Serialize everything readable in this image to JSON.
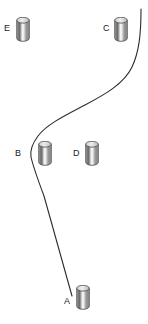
{
  "canvas": {
    "width": 148,
    "height": 324,
    "background": "#ffffff"
  },
  "diagram": {
    "path_color": "#2b2b2b",
    "path_width": 1.1,
    "label_color": "#1a1a1a"
  },
  "cylinder_style": {
    "outline": "#4a4a4a",
    "body_light": "#f2f2f2",
    "body_mid": "#9c9c9c",
    "body_dark": "#6e6e6e",
    "top_fill": "#dcdcdc",
    "width": 14,
    "height": 25
  },
  "markers": [
    {
      "id": "A",
      "label": "A",
      "label_x": 64,
      "label_y": 297,
      "cyl_x": 76,
      "cyl_y": 285,
      "is_path_end": true
    },
    {
      "id": "B",
      "label": "B",
      "label_x": 15,
      "label_y": 149,
      "cyl_x": 38,
      "cyl_y": 141,
      "is_path_end": false
    },
    {
      "id": "C",
      "label": "C",
      "label_x": 103,
      "label_y": 24,
      "cyl_x": 114,
      "cyl_y": 17,
      "is_path_end": false
    },
    {
      "id": "D",
      "label": "D",
      "label_x": 73,
      "label_y": 149,
      "cyl_x": 85,
      "cyl_y": 141,
      "is_path_end": false
    },
    {
      "id": "E",
      "label": "E",
      "label_x": 4,
      "label_y": 24,
      "cyl_x": 16,
      "cyl_y": 17,
      "is_path_end": false
    }
  ],
  "path": {
    "name": "trajectory",
    "d": "M 141 9 C 141 35 139 52 132 67 C 124 84 104 95 85 105 C 66 115 47 124 38 136 C 32 144 30 151 31 157 C 33 166 38 180 44 196 L 72 296",
    "start_point": {
      "x": 141,
      "y": 9
    },
    "end_point": {
      "x": 72,
      "y": 296
    }
  },
  "chart_data": {
    "type": "scatter",
    "xlabel": "",
    "ylabel": "",
    "xlim": [
      0,
      148
    ],
    "ylim": [
      0,
      324
    ],
    "grid": false,
    "legend": "none",
    "series": [
      {
        "name": "obstacles",
        "points": [
          {
            "label": "A",
            "x": 83,
            "y": 297
          },
          {
            "label": "B",
            "x": 45,
            "y": 153
          },
          {
            "label": "C",
            "x": 121,
            "y": 29
          },
          {
            "label": "D",
            "x": 92,
            "y": 153
          },
          {
            "label": "E",
            "x": 23,
            "y": 29
          }
        ]
      },
      {
        "name": "path",
        "type": "line",
        "points": [
          {
            "x": 141,
            "y": 9
          },
          {
            "x": 136,
            "y": 48
          },
          {
            "x": 120,
            "y": 76
          },
          {
            "x": 92,
            "y": 101
          },
          {
            "x": 56,
            "y": 120
          },
          {
            "x": 36,
            "y": 139
          },
          {
            "x": 31,
            "y": 157
          },
          {
            "x": 44,
            "y": 196
          },
          {
            "x": 72,
            "y": 296
          }
        ]
      }
    ]
  }
}
